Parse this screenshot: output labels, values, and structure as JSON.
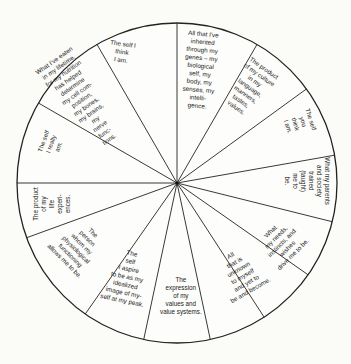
{
  "diagram": {
    "type": "wheel",
    "center": [
      177,
      183
    ],
    "radius": 160,
    "colors": {
      "background": "#fbfbf8",
      "line": "#222222",
      "text": "#222222"
    },
    "segments": [
      {
        "id": "self-i-think",
        "text": "The self I\nthink\nI am.",
        "x": 122,
        "y": 52,
        "rot": 8
      },
      {
        "id": "inherited",
        "text": "All that I've\ninherited\nthrough my\ngenes – my\nbiological\nself, my\nbody, my\nsenses, my\nintelli-\ngence.",
        "x": 200,
        "y": 70,
        "rot": 5
      },
      {
        "id": "culture",
        "text": "The product\nof my culture\nin my\nlanguage,\nmanners,\ntastes,\nvalues.",
        "x": 250,
        "y": 88,
        "rot": 35
      },
      {
        "id": "self-you-think",
        "text": "The self\nyou\nthink\nI am.",
        "x": 299,
        "y": 123,
        "rot": 72
      },
      {
        "id": "parents-society",
        "text": "What my parents\nand society\ntrained\n(taught)\nme to\nbe.",
        "x": 307,
        "y": 181,
        "rot": 90
      },
      {
        "id": "needs-instincts",
        "text": "What\nmy needs,\ninstincts, and\nwishes\ndrive me to be.",
        "x": 282,
        "y": 243,
        "rot": -45
      },
      {
        "id": "unknown",
        "text": "All\nthat is\nunknown\nto myself\nand yet to\nbe and become.",
        "x": 240,
        "y": 273,
        "rot": -30
      },
      {
        "id": "values",
        "text": "The\nexpression\nof my\nvalues and\nvalue systems.",
        "x": 181,
        "y": 296,
        "rot": 0
      },
      {
        "id": "aspire",
        "text": "The\nself\nI aspire\nto be as my\nidealized\nimage of my-\nself at my peak.",
        "x": 127,
        "y": 277,
        "rot": 12
      },
      {
        "id": "physiological",
        "text": "The\nperson\nwhom my\nphysiological\nfunctioning\nallows me to be.",
        "x": 79,
        "y": 247,
        "rot": 45
      },
      {
        "id": "life-experiences",
        "text": "The product\nof my\nlife\nexperi-\nences.",
        "x": 52,
        "y": 204,
        "rot": -90
      },
      {
        "id": "self-really-am",
        "text": "The self\nI really\nam.",
        "x": 51,
        "y": 144,
        "rot": -70
      },
      {
        "id": "nutrition",
        "text": "What I've eaten\nin my lifetime,\nfor my nutrition\nhas helped\ndetermine\nmy cell com-\nposition,\nmy bones,\nmy brains,\nmy\nnerve\nfunc-\ntions.",
        "x": 82,
        "y": 100,
        "rot": -35
      }
    ],
    "spoke_angles_deg": [
      -90,
      -60,
      -36,
      -10,
      14,
      35,
      57,
      78,
      102,
      125,
      160,
      180,
      210,
      240
    ]
  }
}
